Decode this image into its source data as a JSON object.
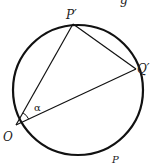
{
  "diagram": {
    "type": "inscribed-circle-geometry",
    "stroke_color": "#111111",
    "background": "#ffffff",
    "circle": {
      "cx": 78,
      "cy": 90,
      "r": 65
    },
    "points": {
      "O": {
        "label": "O",
        "x": 16,
        "y": 125
      },
      "P_prime": {
        "label": "P′",
        "x": 73,
        "y": 24
      },
      "Q_prime": {
        "label": "Q′",
        "x": 136,
        "y": 69
      }
    },
    "angle_label": "α",
    "bottom_label": "P",
    "top_partial_text": "g"
  }
}
